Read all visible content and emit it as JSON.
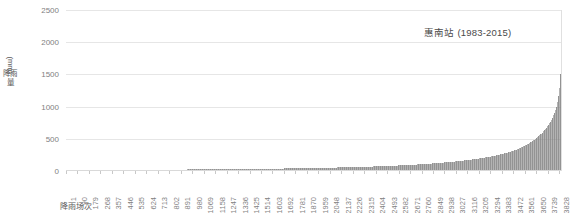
{
  "chart_data": {
    "type": "bar",
    "title": "惠南站 (1983-2015)",
    "xlabel": "降雨场次",
    "ylabel": "降雨量 (mm)",
    "ylabel_unit": "(mm)",
    "ylabel_cjk": "降雨量",
    "ylim": [
      0,
      2500
    ],
    "yticks": [
      0,
      500,
      1000,
      1500,
      2000,
      2500
    ],
    "ytick_labels": [
      "0",
      "500",
      "1000",
      "1500",
      "2000",
      "2500"
    ],
    "xlim": [
      1,
      3850
    ],
    "xticks": [
      1,
      90,
      179,
      268,
      357,
      446,
      535,
      624,
      713,
      802,
      891,
      980,
      1069,
      1158,
      1247,
      1336,
      1425,
      1514,
      1603,
      1692,
      1781,
      1870,
      1959,
      2048,
      2137,
      2226,
      2315,
      2404,
      2493,
      2582,
      2671,
      2760,
      2849,
      2938,
      3027,
      3116,
      3205,
      3294,
      3383,
      3472,
      3561,
      3650,
      3739,
      3828
    ],
    "xtick_labels": [
      "1",
      "90",
      "179",
      "268",
      "357",
      "446",
      "535",
      "624",
      "713",
      "802",
      "891",
      "980",
      "1069",
      "1158",
      "1247",
      "1336",
      "1425",
      "1514",
      "1603",
      "1692",
      "1781",
      "1870",
      "1959",
      "2048",
      "2137",
      "2226",
      "2315",
      "2404",
      "2493",
      "2582",
      "2671",
      "2760",
      "2849",
      "2938",
      "3027",
      "3116",
      "3205",
      "3294",
      "3383",
      "3472",
      "3561",
      "3650",
      "3739",
      "3828"
    ],
    "grid": true,
    "grid_axis": "y",
    "legend": false,
    "bar_color": "#808080",
    "gridline_color": "#e6e6e6",
    "axis_label_color": "#7f7f7f",
    "n_points": 3850,
    "series_name": "降雨量",
    "sampled_profile": {
      "note": "Ascending sorted rainfall totals sampled at the listed event ranks.",
      "x": [
        1,
        200,
        400,
        600,
        800,
        1000,
        1200,
        1400,
        1600,
        1800,
        2000,
        2200,
        2400,
        2600,
        2800,
        3000,
        3100,
        3200,
        3300,
        3400,
        3450,
        3500,
        3550,
        3600,
        3650,
        3700,
        3730,
        3760,
        3780,
        3800,
        3815,
        3825,
        3835,
        3843,
        3848,
        3850
      ],
      "y": [
        0.2,
        1,
        2,
        4,
        6,
        9,
        12,
        16,
        21,
        27,
        34,
        44,
        56,
        72,
        95,
        128,
        150,
        176,
        210,
        255,
        284,
        320,
        365,
        420,
        490,
        580,
        650,
        740,
        815,
        910,
        1020,
        1130,
        1290,
        1520,
        1800,
        2050
      ]
    },
    "max_value": 2050,
    "min_value": 0
  }
}
